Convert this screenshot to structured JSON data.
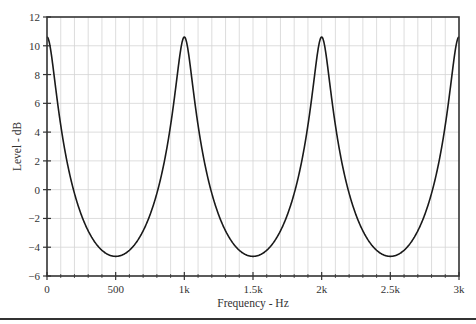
{
  "chart_data": {
    "type": "line",
    "title": "",
    "xlabel": "Frequency - Hz",
    "ylabel": "Level - dB",
    "xlim": [
      0,
      3000
    ],
    "ylim": [
      -6,
      12
    ],
    "x_ticks": [
      0,
      500,
      1000,
      1500,
      2000,
      2500,
      3000
    ],
    "x_tick_labels": [
      "0",
      "500",
      "1k",
      "1.5k",
      "2k",
      "2.5k",
      "3k"
    ],
    "x_minor_step": 100,
    "y_ticks": [
      -6,
      -4,
      -2,
      0,
      2,
      4,
      6,
      8,
      10,
      12
    ],
    "y_tick_labels": [
      "−6",
      "−4",
      "−2",
      "0",
      "2",
      "4",
      "6",
      "8",
      "10",
      "12"
    ],
    "grid": true,
    "legend": null,
    "model": "feedback comb filter, H = 1/(1 - g·e^(-jωT)), g ≈ 0.705, T = 1 ms",
    "gain": 0.705,
    "delay_ms": 1.0,
    "series": [
      {
        "name": "Level",
        "color": "#1a1a1a",
        "x": [
          0,
          100,
          200,
          300,
          400,
          500,
          600,
          700,
          800,
          900,
          1000,
          1100,
          1200,
          1300,
          1400,
          1500,
          1600,
          1700,
          1800,
          1900,
          2000,
          2100,
          2200,
          2300,
          2400,
          2500,
          2600,
          2700,
          2800,
          2900,
          3000
        ],
        "y": [
          10.6,
          4.6,
          -0.1,
          -2.7,
          -4.1,
          -4.6,
          -4.1,
          -2.7,
          -0.1,
          4.6,
          10.6,
          4.6,
          -0.1,
          -2.7,
          -4.1,
          -4.6,
          -4.1,
          -2.7,
          -0.1,
          4.6,
          10.6,
          4.6,
          -0.1,
          -2.7,
          -4.1,
          -4.6,
          -4.1,
          -2.7,
          -0.1,
          4.6,
          10.6
        ]
      }
    ],
    "peaks": [
      {
        "x": 0,
        "y": 10.6
      },
      {
        "x": 1000,
        "y": 10.6
      },
      {
        "x": 2000,
        "y": 10.6
      },
      {
        "x": 3000,
        "y": 10.6
      }
    ],
    "notches": [
      {
        "x": 500,
        "y": -4.6
      },
      {
        "x": 1500,
        "y": -4.6
      },
      {
        "x": 2500,
        "y": -4.6
      }
    ]
  },
  "colors": {
    "curve": "#1a1a1a",
    "axis": "#333333",
    "grid": "#d4d4d4"
  }
}
